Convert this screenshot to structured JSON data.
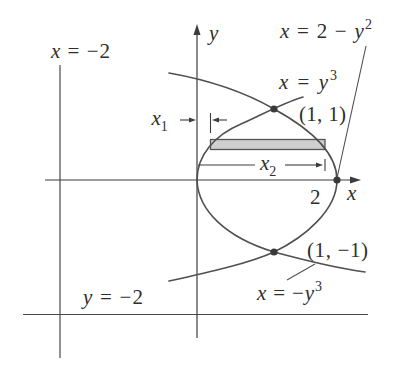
{
  "colors": {
    "curve": "#505050",
    "axis": "#3c3c3c",
    "strip_fill": "#cfcfcf",
    "strip_border": "#555555",
    "point": "#3a3a3a",
    "text": "#2e2e2e"
  },
  "axes": {
    "x_label": "x",
    "y_label": "y",
    "x_tick_label": "2"
  },
  "curves": [
    {
      "id": "parabola",
      "equation": "x = 2 − y²"
    },
    {
      "id": "cubic_upper",
      "equation": "x = y³"
    },
    {
      "id": "cubic_lower",
      "equation": "x = −y³"
    }
  ],
  "boundary_lines": [
    {
      "id": "vertical",
      "equation": "x = −2"
    },
    {
      "id": "horizontal",
      "equation": "y = −2"
    }
  ],
  "points": [
    {
      "label": "(1, 1)",
      "x": 1,
      "y": 1
    },
    {
      "label": "",
      "x": 2,
      "y": 0
    },
    {
      "label": "(1, −1)",
      "x": 1,
      "y": -1
    }
  ],
  "labels": {
    "x_eq_neg2": {
      "text": "x = −2",
      "var": "x",
      "rest": " = −2"
    },
    "y_eq_neg2": {
      "text": "y = −2",
      "var": "y",
      "rest": " = −2"
    },
    "parabola": {
      "text": "x = 2 − y²",
      "var1": "x",
      "mid": " = 2 − ",
      "var2": "y",
      "exp": "2"
    },
    "cubic_upper": {
      "text": "x = y³",
      "var1": "x",
      "mid": " = ",
      "var2": "y",
      "exp": "3"
    },
    "cubic_lower": {
      "text": "x = −y³",
      "var1": "x",
      "mid": " = −",
      "var2": "y",
      "exp": "3"
    },
    "point_upper": "(1, 1)",
    "point_lower": "(1, −1)",
    "x1": {
      "var": "x",
      "sub": "1"
    },
    "x2": {
      "var": "x",
      "sub": "2"
    }
  },
  "strip": {
    "description": "horizontal approximating rectangle between x1 and x2"
  }
}
